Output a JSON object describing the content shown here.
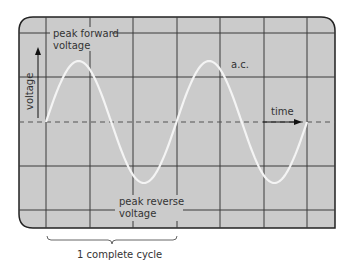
{
  "diagram": {
    "labels": {
      "peak_forward_line1": "peak forward",
      "peak_forward_line2": "voltage",
      "peak_reverse_line1": "peak reverse",
      "peak_reverse_line2": "voltage",
      "ac": "a.c.",
      "time": "time",
      "voltage": "voltage",
      "cycle": "1 complete cycle"
    },
    "colors": {
      "screen": "#cbcbcb",
      "grid": "#3a3a3a",
      "trace": "#f4f4f4",
      "border": "#222222",
      "text": "#333333"
    },
    "waveform": {
      "type": "sine",
      "cycles_shown": 2,
      "start_phase": "zero-crossing rising"
    },
    "grid": {
      "columns": 7,
      "rows": 4
    }
  }
}
